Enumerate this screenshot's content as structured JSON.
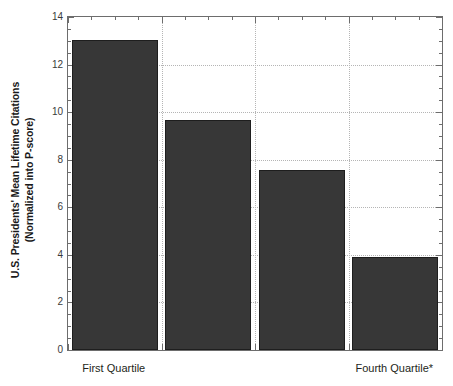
{
  "chart_data": {
    "type": "bar",
    "title": "",
    "xlabel": "",
    "ylabel_line1": "U.S. Presidents' Mean Lifetime Citations",
    "ylabel_line2": "(Normalized into P-score)",
    "categories": [
      "First Quartile",
      "Second Quartile",
      "Third Quartile",
      "Fourth Quartile*"
    ],
    "visible_category_labels": [
      "First Quartile",
      "Fourth Quartile*"
    ],
    "values": [
      13.05,
      9.68,
      7.55,
      3.93
    ],
    "ylim": [
      0,
      14
    ],
    "xlim": [
      0,
      4
    ],
    "y_major_ticks": [
      0,
      2,
      4,
      6,
      8,
      10,
      12,
      14
    ],
    "y_tick_labels": [
      "0",
      "2",
      "4",
      "6",
      "8",
      "10",
      "12",
      "14"
    ],
    "y_minor_tick_interval": 0.5,
    "grid": "horizontal-and-vertical-dotted",
    "legend": "none",
    "bar_color": "#373737",
    "bar_edge_color": "#1e1e1e",
    "axis_color": "#6d6d6d",
    "gridline_color": "#b5b5b5",
    "background": "#ffffff"
  }
}
